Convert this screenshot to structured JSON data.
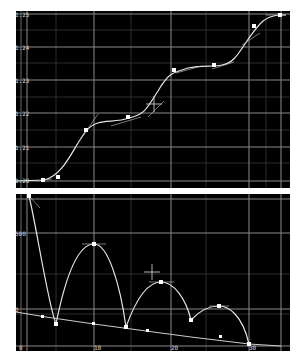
{
  "top_graph": {
    "y_labels": [
      "1.25",
      "1.24",
      "1.23",
      "1.22",
      "1.21",
      "1.20"
    ],
    "keyframes": [
      {
        "t": 0,
        "v": 1.2
      },
      {
        "t": 3,
        "v": 1.201
      },
      {
        "t": 10,
        "v": 1.216
      },
      {
        "t": 14,
        "v": 1.219
      },
      {
        "t": 20,
        "v": 1.233
      },
      {
        "t": 25,
        "v": 1.234
      },
      {
        "t": 33,
        "v": 1.249
      },
      {
        "t": 37,
        "v": 1.25
      }
    ],
    "cursor": "crosshair"
  },
  "bottom_graph": {
    "y_labels": [
      "500",
      "0"
    ],
    "x_labels": [
      "0",
      "10",
      "20",
      "30"
    ],
    "bounce_peaks": [
      {
        "t": 0,
        "v": 900
      },
      {
        "t": 8,
        "v": 0
      },
      {
        "t": 10,
        "v": 480
      },
      {
        "t": 18,
        "v": 0
      },
      {
        "t": 20,
        "v": 250
      },
      {
        "t": 27,
        "v": 0
      },
      {
        "t": 30,
        "v": 110
      },
      {
        "t": 34,
        "v": 0
      }
    ],
    "decay_line": {
      "start": 0,
      "end": 0
    },
    "cursor": "crosshair"
  },
  "colors": {
    "background": "#000000",
    "grid": "#4a4a4a",
    "grid_major": "#9a9a9a",
    "curve": "#e6e6e6",
    "frame": "#ffffff"
  }
}
